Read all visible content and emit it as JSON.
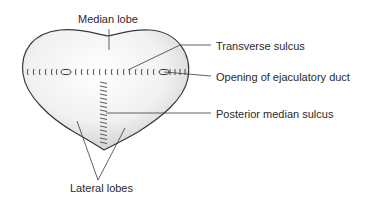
{
  "diagram": {
    "labels": {
      "median_lobe": "Median lobe",
      "transverse_sulcus": "Transverse sulcus",
      "opening_ejaculatory_duct": "Opening of ejaculatory duct",
      "posterior_median_sulcus": "Posterior median sulcus",
      "lateral_lobes": "Lateral lobes"
    },
    "colors": {
      "background": "#ffffff",
      "outline": "#3a3a3a",
      "fill_light": "#ffffff",
      "fill_dark": "#b8b8b8",
      "text": "#2a2a2a",
      "leader_line": "#3a3a3a"
    }
  }
}
